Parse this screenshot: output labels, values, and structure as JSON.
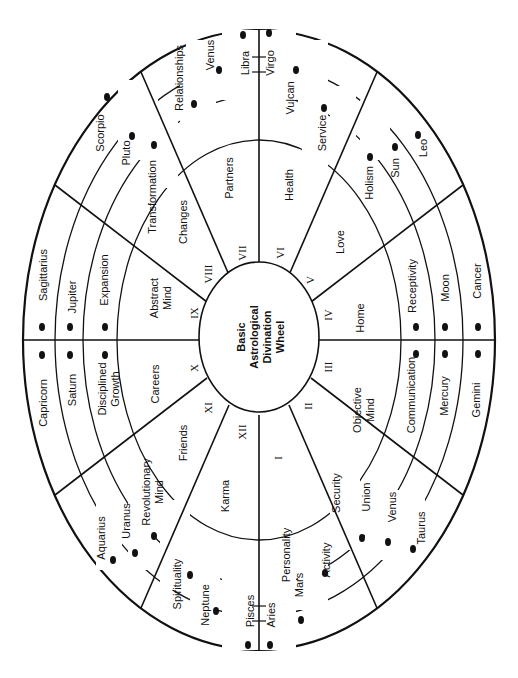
{
  "title": [
    "Basic",
    "Astrological",
    "Divination",
    "Wheel"
  ],
  "colors": {
    "ink": "#111111",
    "background": "#ffffff"
  },
  "houses": [
    {
      "numeral": "I",
      "theme": "Personality"
    },
    {
      "numeral": "II",
      "theme": "Security"
    },
    {
      "numeral": "III",
      "theme": "Objective Mind"
    },
    {
      "numeral": "IV",
      "theme": "Home"
    },
    {
      "numeral": "V",
      "theme": "Love"
    },
    {
      "numeral": "VI",
      "theme": "Health"
    },
    {
      "numeral": "VII",
      "theme": "Partners"
    },
    {
      "numeral": "VIII",
      "theme": "Changes"
    },
    {
      "numeral": "IX",
      "theme": "Abstract Mind"
    },
    {
      "numeral": "X",
      "theme": "Careers"
    },
    {
      "numeral": "XI",
      "theme": "Friends"
    },
    {
      "numeral": "XII",
      "theme": "Karma"
    }
  ],
  "rings": {
    "signs": [
      "Aries",
      "Taurus",
      "Gemini",
      "Cancer",
      "Leo",
      "Virgo",
      "Libra",
      "Scorpio",
      "Sagittarius",
      "Capricorn",
      "Aquarius",
      "Pisces"
    ],
    "planets": [
      "Mars",
      "Venus",
      "Mercury",
      "Moon",
      "Sun",
      "Vulcan",
      "Venus",
      "Pluto",
      "Jupiter",
      "Saturn",
      "Uranus",
      "Neptune"
    ],
    "keywords": [
      "Activity",
      "Union",
      "Communication",
      "Receptivity",
      "Holism",
      "Service",
      "Relationships",
      "Transformation",
      "Expansion",
      "Disciplined Growth",
      "Revolutionary Mind",
      "Spirituality"
    ]
  },
  "labels": {
    "numerals": {
      "I": "I",
      "II": "II",
      "III": "III",
      "IV": "IV",
      "V": "V",
      "VI": "VI",
      "VII": "VII",
      "VIII": "VIII",
      "IX": "IX",
      "X": "X",
      "XI": "XI",
      "XII": "XII"
    },
    "themes": {
      "personality": "Personality",
      "security": "Security",
      "objective_1": "Objective",
      "objective_2": "Mind",
      "home": "Home",
      "love": "Love",
      "health": "Health",
      "partners": "Partners",
      "changes": "Changes",
      "abstract_1": "Abstract",
      "abstract_2": "Mind",
      "careers": "Careers",
      "friends": "Friends",
      "karma": "Karma"
    },
    "signs": {
      "aries": "Aries",
      "taurus": "Taurus",
      "gemini": "Gemini",
      "cancer": "Cancer",
      "leo": "Leo",
      "virgo": "Virgo",
      "libra": "Libra",
      "scorpio": "Scorpio",
      "sagittarius": "Sagittarius",
      "capricorn": "Capricorn",
      "aquarius": "Aquarius",
      "pisces": "Pisces"
    },
    "planets": {
      "mars": "Mars",
      "venus_taurus": "Venus",
      "mercury": "Mercury",
      "moon": "Moon",
      "sun": "Sun",
      "vulcan": "Vulcan",
      "venus_libra": "Venus",
      "pluto": "Pluto",
      "jupiter": "Jupiter",
      "saturn": "Saturn",
      "uranus": "Uranus",
      "neptune": "Neptune"
    },
    "keywords": {
      "activity": "Activity",
      "union": "Union",
      "communication": "Communication",
      "receptivity": "Receptivity",
      "holism": "Holism",
      "service": "Service",
      "relationships": "Relationships",
      "transformation": "Transformation",
      "expansion": "Expansion",
      "disciplined_1": "Disciplined",
      "disciplined_2": "Growth",
      "revolutionary_1": "Revolutionary",
      "revolutionary_2": "Mind",
      "spirituality": "Spirituality"
    }
  }
}
